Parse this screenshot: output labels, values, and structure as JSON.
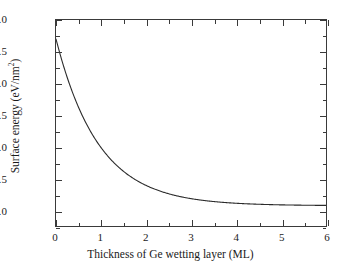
{
  "chart_data": {
    "type": "line",
    "title": "",
    "xlabel": "Thickness of Ge wetting layer (ML)",
    "ylabel_text": "Surface energy (eV/nm",
    "ylabel_sup": "2",
    "ylabel_tail": ")",
    "ylabel_full": "Surface energy (eV/nm²)",
    "xlim": [
      0,
      6
    ],
    "ylim": [
      5.75,
      9.0
    ],
    "xticks": [
      0,
      1,
      2,
      3,
      4,
      5,
      6
    ],
    "xticklabels": [
      "0",
      "1",
      "2",
      "3",
      "4",
      "5",
      "6"
    ],
    "xminor_ticks": [
      0.5,
      1.5,
      2.5,
      3.5,
      4.5,
      5.5
    ],
    "yticks": [
      6.0,
      6.5,
      7.0,
      7.5,
      8.0,
      8.5,
      9.0
    ],
    "yticklabels": [
      "6.0",
      "6.5",
      "7.0",
      "7.5",
      "8.0",
      "8.5",
      "9.0"
    ],
    "yminor_ticks": [
      5.75,
      6.25,
      6.75,
      7.25,
      7.75,
      8.25,
      8.75
    ],
    "grid": false,
    "legend": null,
    "line_color": "#2b2b2b",
    "line_width": 1.1,
    "series": [
      {
        "name": "surface energy",
        "x": [
          0.0,
          0.1,
          0.2,
          0.3,
          0.4,
          0.5,
          0.6,
          0.7,
          0.8,
          0.9,
          1.0,
          1.1,
          1.2,
          1.3,
          1.4,
          1.5,
          1.6,
          1.7,
          1.8,
          1.9,
          2.0,
          2.2,
          2.4,
          2.6,
          2.8,
          3.0,
          3.2,
          3.4,
          3.6,
          3.8,
          4.0,
          4.25,
          4.5,
          4.75,
          5.0,
          5.25,
          5.5,
          5.75,
          6.0
        ],
        "y": [
          8.7,
          8.44,
          8.2,
          7.98,
          7.78,
          7.59,
          7.42,
          7.26,
          7.11,
          6.98,
          6.86,
          6.75,
          6.65,
          6.56,
          6.48,
          6.41,
          6.34,
          6.28,
          6.23,
          6.18,
          6.14,
          6.07,
          6.02,
          5.98,
          5.95,
          5.92,
          5.9,
          5.89,
          5.88,
          5.87,
          5.86,
          5.855,
          5.85,
          5.848,
          5.846,
          5.845,
          5.844,
          5.843,
          5.842
        ]
      }
    ],
    "curve_model": {
      "form": "y = y0 + A*exp(-x/tau)",
      "y0": 6.07,
      "A": 2.63,
      "tau": 0.95,
      "start_point": [
        0.0,
        8.7
      ],
      "end_point": [
        6.0,
        6.07
      ],
      "asymptote": 6.07
    }
  }
}
